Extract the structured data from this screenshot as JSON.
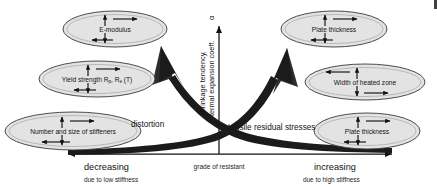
{
  "diagram": {
    "axes": {
      "vertical_label_line1": "shrinkage tendency,",
      "vertical_label_line2": "termal expansion coeff.",
      "vertical_label_symbol": "α",
      "horizontal_center": "grade of resistant",
      "horizontal_left_main": "decreasing",
      "horizontal_left_sub": "due to low stiffness",
      "horizontal_right_main": "increasing",
      "horizontal_right_sub": "due to high stiffness"
    },
    "curve_labels": {
      "left": "distortion",
      "right": "tensile residual stresses"
    },
    "factors": [
      {
        "id": "e-modulus",
        "label": "E-modulus",
        "side": "left",
        "arrows": "normal"
      },
      {
        "id": "yield-strength",
        "label": "Yield strength R",
        "label_sub1": "p",
        "label_mid": ", R",
        "label_sub2": "e",
        "label_tail": " (T)",
        "side": "left",
        "arrows": "normal"
      },
      {
        "id": "stiffeners",
        "label": "Number and size of stiffeners",
        "side": "left",
        "arrows": "normal"
      },
      {
        "id": "plate-thickness-top",
        "label": "Plate thickness",
        "side": "right",
        "arrows": "normal"
      },
      {
        "id": "width-heated-zone",
        "label": "Width of heated zone",
        "side": "right",
        "arrows": "mirrored"
      },
      {
        "id": "plate-thickness-bot",
        "label": "Plate thickness",
        "side": "right",
        "arrows": "normal"
      }
    ],
    "colors": {
      "ellipse_fill": "#e3e3e3",
      "ellipse_stroke": "#3a3a3a",
      "arrow_dark": "#1b1b1b",
      "text": "#131313",
      "background": "#ffffff"
    }
  }
}
